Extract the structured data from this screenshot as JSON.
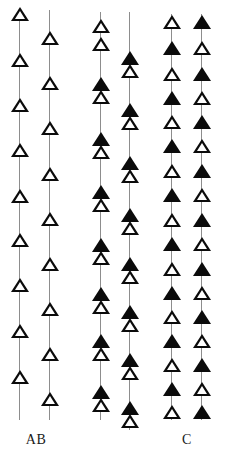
{
  "figure": {
    "title": "",
    "background_color": "#ffffff",
    "width": 226,
    "height": 455,
    "marker_colors": {
      "solid_fill": "#0b0b0b",
      "hollow_fill": "#ffffff",
      "outline": "#0b0b0b",
      "axis_line": "#8d8d8d"
    }
  },
  "chart_data": {
    "type": "scatter",
    "title": "",
    "xlabel": "",
    "ylabel": "",
    "grid": false,
    "legend_position": "none",
    "marker_legend": [
      {
        "symbol": "open-triangle",
        "name": "hollow",
        "fill": "#ffffff",
        "outline": "#0b0b0b"
      },
      {
        "symbol": "filled-triangle",
        "name": "solid",
        "fill": "#0b0b0b",
        "outline": "#0b0b0b"
      }
    ],
    "ylim": [
      0,
      420
    ],
    "columns": [
      {
        "id": "col-1",
        "group": "AB",
        "x": 20,
        "line_top": 14,
        "line_bottom": 420,
        "count": 9,
        "markers": [
          {
            "y": 14,
            "type": "hollow"
          },
          {
            "y": 60,
            "type": "hollow"
          },
          {
            "y": 105,
            "type": "hollow"
          },
          {
            "y": 150,
            "type": "hollow"
          },
          {
            "y": 196,
            "type": "hollow"
          },
          {
            "y": 240,
            "type": "hollow"
          },
          {
            "y": 285,
            "type": "hollow"
          },
          {
            "y": 331,
            "type": "hollow"
          },
          {
            "y": 377,
            "type": "hollow"
          }
        ]
      },
      {
        "id": "col-2",
        "group": "AB",
        "x": 50,
        "line_top": 10,
        "line_bottom": 420,
        "count": 9,
        "markers": [
          {
            "y": 38,
            "type": "hollow"
          },
          {
            "y": 83,
            "type": "hollow"
          },
          {
            "y": 128,
            "type": "hollow"
          },
          {
            "y": 174,
            "type": "hollow"
          },
          {
            "y": 219,
            "type": "hollow"
          },
          {
            "y": 264,
            "type": "hollow"
          },
          {
            "y": 309,
            "type": "hollow"
          },
          {
            "y": 354,
            "type": "hollow"
          },
          {
            "y": 399,
            "type": "hollow"
          }
        ]
      },
      {
        "id": "col-3",
        "group": "middle",
        "x": 101,
        "line_top": 12,
        "line_bottom": 420,
        "count": 16,
        "markers": [
          {
            "y": 26,
            "type": "hollow"
          },
          {
            "y": 44,
            "type": "hollow"
          },
          {
            "y": 84,
            "type": "solid"
          },
          {
            "y": 97,
            "type": "hollow"
          },
          {
            "y": 139,
            "type": "solid"
          },
          {
            "y": 152,
            "type": "hollow"
          },
          {
            "y": 192,
            "type": "solid"
          },
          {
            "y": 205,
            "type": "hollow"
          },
          {
            "y": 245,
            "type": "solid"
          },
          {
            "y": 258,
            "type": "hollow"
          },
          {
            "y": 294,
            "type": "solid"
          },
          {
            "y": 307,
            "type": "hollow"
          },
          {
            "y": 341,
            "type": "solid"
          },
          {
            "y": 354,
            "type": "hollow"
          },
          {
            "y": 392,
            "type": "solid"
          },
          {
            "y": 405,
            "type": "hollow"
          }
        ]
      },
      {
        "id": "col-4",
        "group": "middle",
        "x": 130,
        "line_top": 12,
        "line_bottom": 430,
        "count": 16,
        "markers": [
          {
            "y": 58,
            "type": "solid"
          },
          {
            "y": 71,
            "type": "hollow"
          },
          {
            "y": 110,
            "type": "solid"
          },
          {
            "y": 123,
            "type": "hollow"
          },
          {
            "y": 163,
            "type": "solid"
          },
          {
            "y": 176,
            "type": "hollow"
          },
          {
            "y": 215,
            "type": "solid"
          },
          {
            "y": 228,
            "type": "hollow"
          },
          {
            "y": 264,
            "type": "solid"
          },
          {
            "y": 277,
            "type": "hollow"
          },
          {
            "y": 312,
            "type": "solid"
          },
          {
            "y": 325,
            "type": "hollow"
          },
          {
            "y": 360,
            "type": "solid"
          },
          {
            "y": 373,
            "type": "hollow"
          },
          {
            "y": 408,
            "type": "solid"
          },
          {
            "y": 421,
            "type": "hollow"
          }
        ]
      },
      {
        "id": "col-5",
        "group": "C",
        "x": 172,
        "line_top": 14,
        "line_bottom": 420,
        "count": 17,
        "markers": [
          {
            "y": 22,
            "type": "hollow"
          },
          {
            "y": 48,
            "type": "solid"
          },
          {
            "y": 74,
            "type": "hollow"
          },
          {
            "y": 98,
            "type": "solid"
          },
          {
            "y": 122,
            "type": "hollow"
          },
          {
            "y": 146,
            "type": "solid"
          },
          {
            "y": 171,
            "type": "hollow"
          },
          {
            "y": 195,
            "type": "solid"
          },
          {
            "y": 220,
            "type": "hollow"
          },
          {
            "y": 244,
            "type": "solid"
          },
          {
            "y": 269,
            "type": "hollow"
          },
          {
            "y": 293,
            "type": "solid"
          },
          {
            "y": 317,
            "type": "hollow"
          },
          {
            "y": 341,
            "type": "solid"
          },
          {
            "y": 365,
            "type": "hollow"
          },
          {
            "y": 389,
            "type": "solid"
          },
          {
            "y": 412,
            "type": "hollow"
          }
        ]
      },
      {
        "id": "col-6",
        "group": "C",
        "x": 202,
        "line_top": 14,
        "line_bottom": 420,
        "count": 17,
        "markers": [
          {
            "y": 22,
            "type": "solid"
          },
          {
            "y": 48,
            "type": "hollow"
          },
          {
            "y": 74,
            "type": "solid"
          },
          {
            "y": 98,
            "type": "hollow"
          },
          {
            "y": 122,
            "type": "solid"
          },
          {
            "y": 146,
            "type": "hollow"
          },
          {
            "y": 171,
            "type": "solid"
          },
          {
            "y": 195,
            "type": "hollow"
          },
          {
            "y": 220,
            "type": "solid"
          },
          {
            "y": 244,
            "type": "hollow"
          },
          {
            "y": 269,
            "type": "solid"
          },
          {
            "y": 293,
            "type": "hollow"
          },
          {
            "y": 317,
            "type": "solid"
          },
          {
            "y": 341,
            "type": "hollow"
          },
          {
            "y": 365,
            "type": "solid"
          },
          {
            "y": 389,
            "type": "hollow"
          },
          {
            "y": 412,
            "type": "solid"
          }
        ]
      }
    ],
    "group_labels": [
      {
        "id": "label-ab",
        "text": "AB",
        "x": 36,
        "y": 432
      },
      {
        "id": "label-c",
        "text": "C",
        "x": 187,
        "y": 432
      }
    ]
  }
}
